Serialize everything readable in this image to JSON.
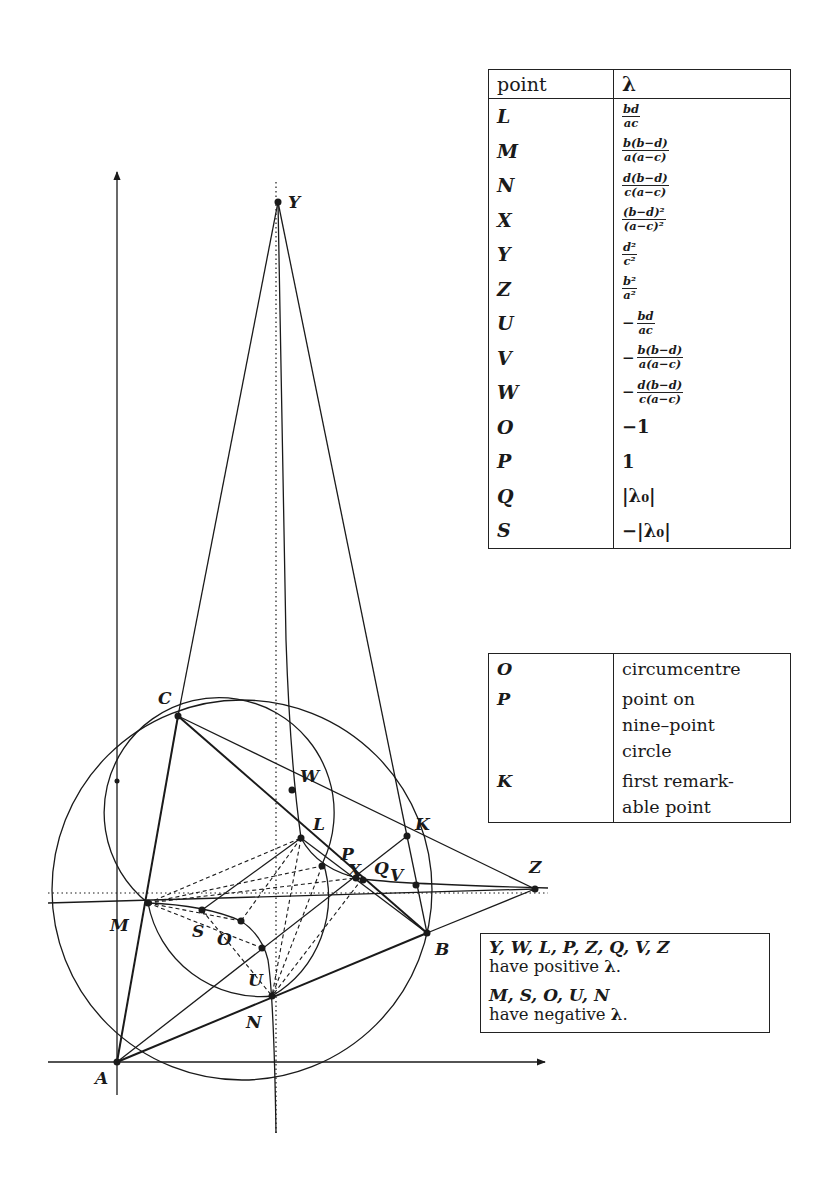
{
  "diagram": {
    "axes": {
      "x_axis": {
        "from": [
          48,
          1062
        ],
        "to": [
          545,
          1062
        ],
        "arrow": true
      },
      "y_axis": {
        "from": [
          117,
          1095
        ],
        "to": [
          117,
          172
        ],
        "arrow": true
      }
    },
    "points": [
      {
        "name": "A",
        "x": 117,
        "y": 1062,
        "label_dx": -22,
        "label_dy": 22
      },
      {
        "name": "B",
        "x": 427,
        "y": 933,
        "label_dx": 8,
        "label_dy": 22
      },
      {
        "name": "C",
        "x": 178,
        "y": 716,
        "label_dx": -20,
        "label_dy": -12
      },
      {
        "name": "K",
        "x": 407,
        "y": 836,
        "label_dx": 8,
        "label_dy": -6
      },
      {
        "name": "Z",
        "x": 535,
        "y": 889,
        "label_dx": -6,
        "label_dy": -16
      },
      {
        "name": "Y",
        "x": 278,
        "y": 202,
        "label_dx": 10,
        "label_dy": 6
      },
      {
        "name": "W",
        "x": 292,
        "y": 790,
        "label_dx": 8,
        "label_dy": -8
      },
      {
        "name": "L",
        "x": 301,
        "y": 838,
        "label_dx": 12,
        "label_dy": -8
      },
      {
        "name": "P",
        "x": 355,
        "y": 878,
        "label_dx": -14,
        "label_dy": -18
      },
      {
        "name": "X",
        "x": 362,
        "y": 879,
        "label_dx": -14,
        "label_dy": -3
      },
      {
        "name": "Q",
        "x": 364,
        "y": 880,
        "label_dx": 10,
        "label_dy": -6
      },
      {
        "name": "V",
        "x": 416,
        "y": 885,
        "label_dx": -26,
        "label_dy": -4
      },
      {
        "name": "M",
        "x": 148,
        "y": 903,
        "label_dx": -38,
        "label_dy": 28
      },
      {
        "name": "S",
        "x": 202,
        "y": 910,
        "label_dx": -10,
        "label_dy": 27
      },
      {
        "name": "O",
        "x": 241,
        "y": 921,
        "label_dx": -24,
        "label_dy": 24
      },
      {
        "name": "U",
        "x": 262,
        "y": 948,
        "label_dx": -14,
        "label_dy": 38
      },
      {
        "name": "N",
        "x": 272,
        "y": 996,
        "label_dx": -26,
        "label_dy": 32
      }
    ],
    "circles": [
      {
        "name": "circumcircle",
        "cx": 242,
        "cy": 890,
        "r": 190
      },
      {
        "name": "nine-point-circle",
        "cx": 232,
        "cy": 898,
        "r": 115
      }
    ]
  },
  "lambda_table": {
    "headers": {
      "point": "point",
      "lambda": "λ"
    },
    "rows": [
      {
        "point": "L",
        "sign": "",
        "num": "bd",
        "den": "ac"
      },
      {
        "point": "M",
        "sign": "",
        "num": "b(b−d)",
        "den": "a(a−c)"
      },
      {
        "point": "N",
        "sign": "",
        "num": "d(b−d)",
        "den": "c(a−c)"
      },
      {
        "point": "X",
        "sign": "",
        "num": "(b−d)²",
        "den": "(a−c)²"
      },
      {
        "point": "Y",
        "sign": "",
        "num": "d²",
        "den": "c²"
      },
      {
        "point": "Z",
        "sign": "",
        "num": "b²",
        "den": "a²"
      },
      {
        "point": "U",
        "sign": "−",
        "num": "bd",
        "den": "ac"
      },
      {
        "point": "V",
        "sign": "−",
        "num": "b(b−d)",
        "den": "a(a−c)"
      },
      {
        "point": "W",
        "sign": "−",
        "num": "d(b−d)",
        "den": "c(a−c)"
      },
      {
        "point": "O",
        "value": "−1"
      },
      {
        "point": "P",
        "value": "1"
      },
      {
        "point": "Q",
        "value": "|λ₀|"
      },
      {
        "point": "S",
        "value": "−|λ₀|"
      }
    ]
  },
  "description_table": {
    "rows": [
      {
        "point": "O",
        "lines": [
          "circumcentre"
        ]
      },
      {
        "point": "P",
        "lines": [
          "point on",
          "nine–point",
          "circle"
        ]
      },
      {
        "point": "K",
        "lines": [
          "first remark-",
          "able point"
        ]
      }
    ]
  },
  "sign_box": {
    "positive_points": "Y, W, L, P, Z, Q, V, Z",
    "positive_text": "have positive",
    "negative_points": "M, S, O, U, N",
    "negative_text": "have negative",
    "lambda": "λ",
    "period": "."
  }
}
